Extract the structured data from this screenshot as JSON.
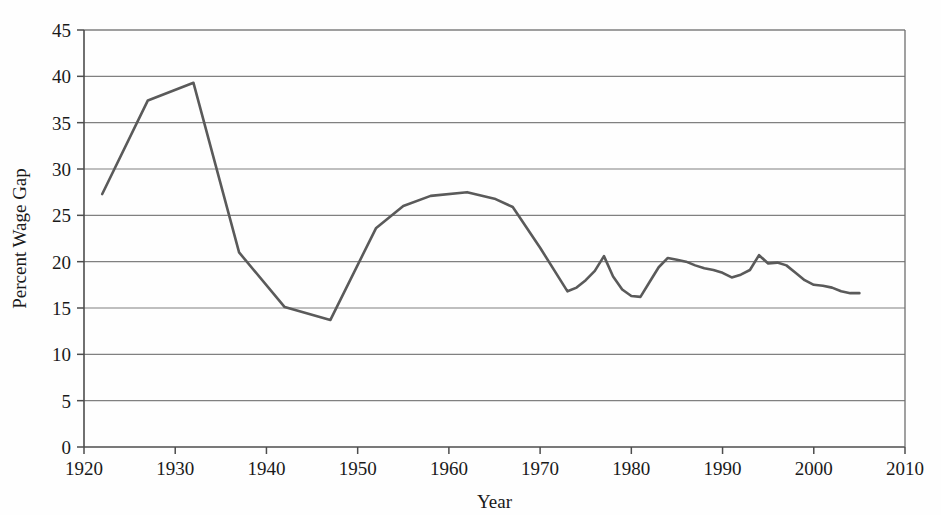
{
  "chart_data": {
    "type": "line",
    "title": "",
    "xlabel": "Year",
    "ylabel": "Percent Wage Gap",
    "xlim": [
      1920,
      2010
    ],
    "ylim": [
      0,
      45
    ],
    "xticks": [
      1920,
      1930,
      1940,
      1950,
      1960,
      1970,
      1980,
      1990,
      2000,
      2010
    ],
    "yticks": [
      0,
      5,
      10,
      15,
      20,
      25,
      30,
      35,
      40,
      45
    ],
    "grid": "horizontal",
    "legend": "none",
    "line_color": "#5a5a5a",
    "grid_color": "#808080",
    "axis_color": "#4d4d4d",
    "background_color": "#fefefe",
    "series": [
      {
        "name": "Percent Wage Gap",
        "x": [
          1922,
          1927,
          1932,
          1937,
          1942,
          1947,
          1952,
          1955,
          1958,
          1962,
          1965,
          1967,
          1970,
          1973,
          1974,
          1975,
          1976,
          1977,
          1978,
          1979,
          1980,
          1981,
          1982,
          1983,
          1984,
          1985,
          1986,
          1987,
          1988,
          1989,
          1990,
          1991,
          1992,
          1993,
          1994,
          1995,
          1996,
          1997,
          1998,
          1999,
          2000,
          2001,
          2002,
          2003,
          2004,
          2005
        ],
        "values": [
          27.3,
          37.4,
          39.3,
          21.0,
          15.1,
          13.7,
          23.6,
          26.0,
          27.1,
          27.5,
          26.8,
          25.9,
          21.5,
          16.8,
          17.2,
          18.0,
          19.0,
          20.6,
          18.4,
          17.0,
          16.3,
          16.2,
          17.8,
          19.4,
          20.4,
          20.2,
          20.0,
          19.6,
          19.3,
          19.1,
          18.8,
          18.3,
          18.6,
          19.1,
          20.7,
          19.8,
          19.9,
          19.6,
          18.8,
          18.0,
          17.5,
          17.4,
          17.2,
          16.8,
          16.6,
          16.6
        ]
      }
    ]
  }
}
